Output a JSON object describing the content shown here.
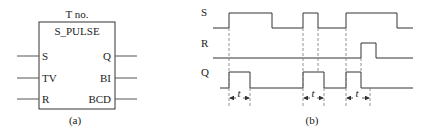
{
  "panel_a": {
    "block_number": "T no.",
    "block_name": "S_PULSE",
    "inputs": [
      "S",
      "TV",
      "R"
    ],
    "outputs": [
      "Q",
      "BI",
      "BCD"
    ],
    "caption": "(a)"
  },
  "panel_b": {
    "signals": [
      "S",
      "R",
      "Q"
    ],
    "duration_label": "t",
    "caption": "(b)",
    "timing": {
      "S": [
        [
          213,
          0
        ],
        [
          229,
          1
        ],
        [
          272,
          0
        ],
        [
          303,
          1
        ],
        [
          318,
          0
        ],
        [
          346,
          1
        ],
        [
          397,
          0
        ],
        [
          413,
          0
        ]
      ],
      "R": [
        [
          213,
          0
        ],
        [
          361,
          1
        ],
        [
          376,
          0
        ],
        [
          413,
          0
        ]
      ],
      "Q": [
        [
          220,
          0
        ],
        [
          229,
          1
        ],
        [
          250,
          0
        ],
        [
          303,
          1
        ],
        [
          324,
          0
        ],
        [
          346,
          1
        ],
        [
          361,
          0
        ],
        [
          413,
          0
        ]
      ]
    }
  },
  "colors": {
    "line": "#333333",
    "dash": "#666666"
  }
}
